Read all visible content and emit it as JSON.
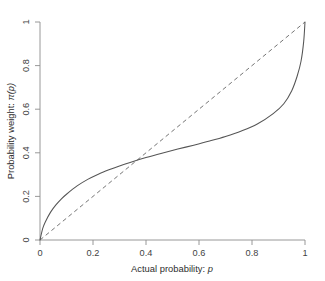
{
  "chart_data": {
    "type": "line",
    "title": "",
    "xlabel": "Actual probability: p",
    "ylabel": "Probability weight: π(p)",
    "xlim": [
      0,
      1
    ],
    "ylim": [
      0,
      1
    ],
    "grid": false,
    "legend": "none",
    "xticks": [
      "0",
      "0.2",
      "0.4",
      "0.6",
      "0.8",
      "1"
    ],
    "xtick_values": [
      0,
      0.2,
      0.4,
      0.6,
      0.8,
      1
    ],
    "yticks": [
      "0",
      "0.2",
      "0.4",
      "0.6",
      "0.8",
      "1"
    ],
    "ytick_values": [
      0,
      0.2,
      0.4,
      0.6,
      0.8,
      1
    ],
    "series": [
      {
        "name": "Probability weighting function",
        "style": "solid",
        "color": "#555555",
        "x": [
          0,
          0.01,
          0.02,
          0.04,
          0.06,
          0.08,
          0.1,
          0.14,
          0.18,
          0.22,
          0.26,
          0.3,
          0.34,
          0.4,
          0.46,
          0.52,
          0.58,
          0.64,
          0.7,
          0.76,
          0.82,
          0.88,
          0.92,
          0.95,
          0.97,
          0.985,
          0.995,
          1
        ],
        "values": [
          0,
          0.052,
          0.083,
          0.128,
          0.161,
          0.188,
          0.21,
          0.248,
          0.278,
          0.302,
          0.322,
          0.34,
          0.356,
          0.378,
          0.398,
          0.417,
          0.435,
          0.454,
          0.475,
          0.5,
          0.532,
          0.58,
          0.625,
          0.685,
          0.75,
          0.82,
          0.91,
          1
        ]
      },
      {
        "name": "45-degree identity line",
        "style": "dashed",
        "color": "#6e6e6e",
        "x": [
          0,
          1
        ],
        "values": [
          0,
          1
        ]
      }
    ],
    "annotations": [
      {
        "label": "crossing point",
        "x": 0.34,
        "y": 0.34
      }
    ]
  },
  "axes": {
    "x_title": "Actual probability: p",
    "x_title_main": "Actual probability: ",
    "x_title_var": "p",
    "y_title": "Probability weight: π(p)",
    "y_title_main": "Probability weight: ",
    "y_title_var": "π(p)"
  },
  "colors": {
    "background": "#ffffff",
    "axis": "#8d8d8d",
    "curve": "#555555",
    "reference_line": "#6e6e6e",
    "text": "#3a3a3a"
  }
}
